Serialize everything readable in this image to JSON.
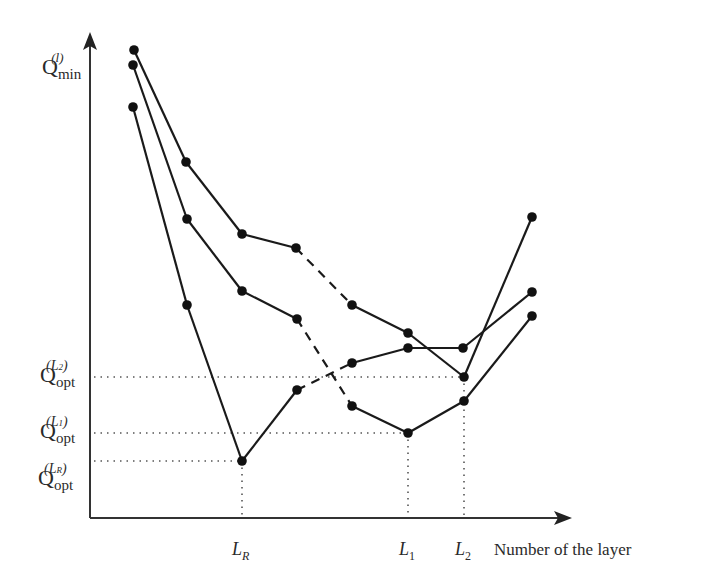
{
  "chart_data": {
    "type": "line",
    "title": "",
    "ylabel": "Q_min^(l)",
    "xlabel": "Number of the layer",
    "x_ticks": [
      {
        "label": "L_R",
        "x": 242
      },
      {
        "label": "L_1",
        "x": 408
      },
      {
        "label": "L_2",
        "x": 464
      }
    ],
    "y_ticks": [
      {
        "label": "Q_opt^(L_2)",
        "y": 377
      },
      {
        "label": "Q_opt^(L_1)",
        "y": 433
      },
      {
        "label": "Q_opt^(L_R)",
        "y": 461
      }
    ],
    "series": [
      {
        "name": "curve-1",
        "points": [
          [
            134,
            50
          ],
          [
            186,
            162
          ],
          [
            242,
            234
          ],
          [
            296,
            248
          ],
          [
            352,
            305
          ],
          [
            408,
            333
          ],
          [
            464,
            377
          ],
          [
            532,
            217
          ]
        ],
        "dashed_segment": [
          3,
          4
        ]
      },
      {
        "name": "curve-2",
        "points": [
          [
            133,
            65
          ],
          [
            187,
            219
          ],
          [
            242,
            291
          ],
          [
            297,
            319
          ],
          [
            352,
            406
          ],
          [
            408,
            433
          ],
          [
            464,
            401
          ],
          [
            532,
            316
          ]
        ],
        "dashed_segment": [
          3,
          4
        ]
      },
      {
        "name": "curve-3",
        "points": [
          [
            133,
            107
          ],
          [
            187,
            305
          ],
          [
            242,
            461
          ],
          [
            297,
            390
          ],
          [
            352,
            363
          ],
          [
            408,
            348
          ],
          [
            463,
            348
          ],
          [
            532,
            292
          ]
        ],
        "dashed_segment": [
          3,
          4
        ]
      }
    ],
    "grid": false,
    "legend": "none"
  },
  "labels": {
    "y_axis": {
      "q": "Q",
      "sub": "min",
      "sup": "(l)"
    },
    "opt_L2": {
      "q": "Q",
      "sub": "opt",
      "sup": "(L",
      "supsub": "2",
      "close": ")"
    },
    "opt_L1": {
      "q": "Q",
      "sub": "opt",
      "sup": "(L",
      "supsub": "1",
      "close": ")"
    },
    "opt_LR": {
      "q": "Q",
      "sub": "opt",
      "sup": "(L",
      "supsub": "R",
      "close": ")"
    },
    "x_LR": {
      "main": "L",
      "sub": "R"
    },
    "x_L1": {
      "main": "L",
      "sub": "1"
    },
    "x_L2": {
      "main": "L",
      "sub": "2"
    },
    "x_axis_title": "Number of the layer"
  },
  "colors": {
    "line": "#1a1a1a",
    "axis": "#333333",
    "dots": "#555555"
  }
}
